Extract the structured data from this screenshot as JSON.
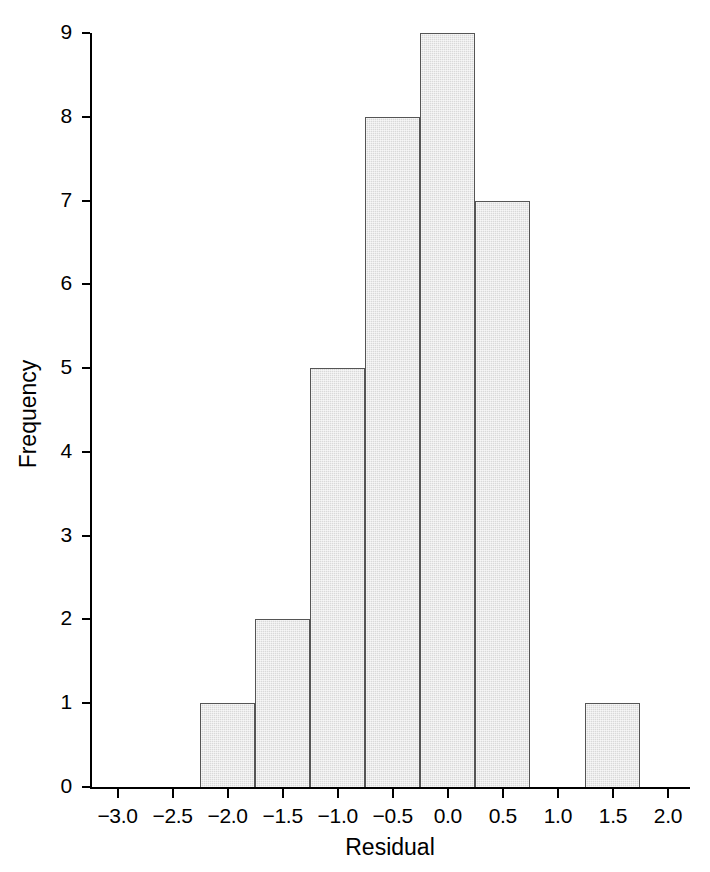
{
  "chart_data": {
    "type": "bar",
    "title": "",
    "subtitle": "",
    "xlabel": "Residual",
    "ylabel": "Frequency",
    "xlim": [
      -3.25,
      2.2
    ],
    "ylim": [
      0,
      9
    ],
    "grid": false,
    "legend": null,
    "annotations": [],
    "bin_width": 0.5,
    "xticks": [
      -3.0,
      -2.5,
      -2.0,
      -1.5,
      -1.0,
      -0.5,
      0.0,
      0.5,
      1.0,
      1.5,
      2.0
    ],
    "xticklabels": [
      "−3.0",
      "−2.5",
      "−2.0",
      "−1.5",
      "−1.0",
      "−0.5",
      "0.0",
      "0.5",
      "1.0",
      "1.5",
      "2.0"
    ],
    "yticks": [
      0,
      1,
      2,
      3,
      4,
      5,
      6,
      7,
      8,
      9
    ],
    "yticklabels": [
      "0",
      "1",
      "2",
      "3",
      "4",
      "5",
      "6",
      "7",
      "8",
      "9"
    ],
    "bins": [
      {
        "left": -2.25,
        "right": -1.75,
        "value": 1
      },
      {
        "left": -1.75,
        "right": -1.25,
        "value": 2
      },
      {
        "left": -1.25,
        "right": -0.75,
        "value": 5
      },
      {
        "left": -0.75,
        "right": -0.25,
        "value": 8
      },
      {
        "left": -0.25,
        "right": 0.25,
        "value": 9
      },
      {
        "left": 0.25,
        "right": 0.75,
        "value": 7
      },
      {
        "left": 1.25,
        "right": 1.75,
        "value": 1
      }
    ],
    "categories": [
      "-2.25 to -1.75",
      "-1.75 to -1.25",
      "-1.25 to -0.75",
      "-0.75 to -0.25",
      "-0.25 to 0.25",
      "0.25 to 0.75",
      "1.25 to 1.75"
    ],
    "values": [
      1,
      2,
      5,
      8,
      9,
      7,
      1
    ],
    "total_count": 33,
    "colors": {
      "bar_fill": "#d9d9d9",
      "bar_edge": "#555555",
      "axis": "#000000",
      "background": "#ffffff",
      "text": "#000000"
    }
  }
}
